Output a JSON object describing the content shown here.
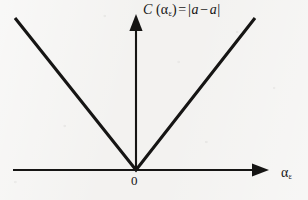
{
  "figure": {
    "background_color": "#f3f2f0",
    "ink_color": "#161514",
    "width": 308,
    "height": 200
  },
  "labels": {
    "y_axis": {
      "function_name": "C",
      "open_paren": "(",
      "argument_symbol": "α",
      "argument_subscript": "ε",
      "close_paren": ")",
      "equals": "=",
      "left_bar": "|",
      "term_a": "a",
      "minus": "−",
      "term_a_hat_base": "a",
      "term_a_hat_accent": "ˆ",
      "right_bar": "|",
      "full_text": "C (αε) = |a − â|"
    },
    "x_axis": {
      "symbol": "α",
      "subscript": "ε",
      "full_text": "αε"
    },
    "origin": "0"
  },
  "chart_data": {
    "type": "line",
    "title": "",
    "subtitle": "",
    "xlabel": "αε",
    "ylabel": "C (αε) = |a − â|",
    "grid": false,
    "legend": "none",
    "axes": {
      "x_axis_y_pixel": 170,
      "y_axis_x_pixel": 136,
      "x_axis_start_pixel": 13,
      "x_axis_end_pixel": 262,
      "y_axis_top_pixel": 22,
      "x_arrow": true,
      "y_arrow": true,
      "arrowhead_style": "solid-triangle",
      "tick_labels_x": [
        "0"
      ],
      "tick_labels_y": []
    },
    "series": [
      {
        "name": "absolute error cost",
        "shape": "v",
        "description": "piecewise-linear absolute value function with vertex at the origin",
        "points_pixel": [
          [
            15,
            18
          ],
          [
            136,
            170
          ],
          [
            255,
            18
          ]
        ],
        "x": [
          -1,
          0,
          1
        ],
        "values": [
          1,
          0,
          1
        ],
        "vertex": {
          "x": 0,
          "y": 0
        },
        "left_slope": -1,
        "right_slope": 1,
        "color": "#161514",
        "line_width": 3.1
      }
    ],
    "xlim": [
      -1.05,
      1.1
    ],
    "ylim": [
      0,
      1.05
    ],
    "annotations": [
      {
        "text": "0",
        "x_pixel": 136,
        "y_pixel": 181,
        "role": "origin-label"
      }
    ]
  }
}
